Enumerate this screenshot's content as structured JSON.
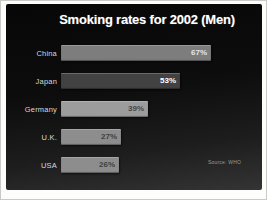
{
  "slide": {
    "title": "Smoking rates for 2002 (Men)",
    "source": "Source: WHO",
    "background_top": "#070707",
    "background_bottom": "#343434",
    "frame_color": "#fdfdfc",
    "title_color": "#ffffff"
  },
  "chart_data": {
    "type": "bar",
    "orientation": "horizontal",
    "title": "Smoking rates for 2002 (Men)",
    "categories": [
      "China",
      "Japan",
      "Germany",
      "U.K.",
      "USA"
    ],
    "values": [
      67,
      53,
      39,
      27,
      26
    ],
    "value_labels": [
      "67%",
      "53%",
      "39%",
      "27%",
      "26%"
    ],
    "bar_colors": [
      "#7d7d7d",
      "#424242",
      "#9c9c9c",
      "#8d8d8d",
      "#8d8d8d"
    ],
    "value_label_colors": [
      "#e6e6e6",
      "#ffffff",
      "#474747",
      "#3f3f3f",
      "#3f3f3f"
    ],
    "category_label_color": "#d8d8d8",
    "xlim": [
      0,
      100
    ],
    "px_per_percent": 2.24,
    "bars_start_x": 54,
    "row_tops": [
      41,
      69,
      97,
      125,
      153
    ],
    "grid": false,
    "legend": false,
    "source": "Source: WHO"
  }
}
